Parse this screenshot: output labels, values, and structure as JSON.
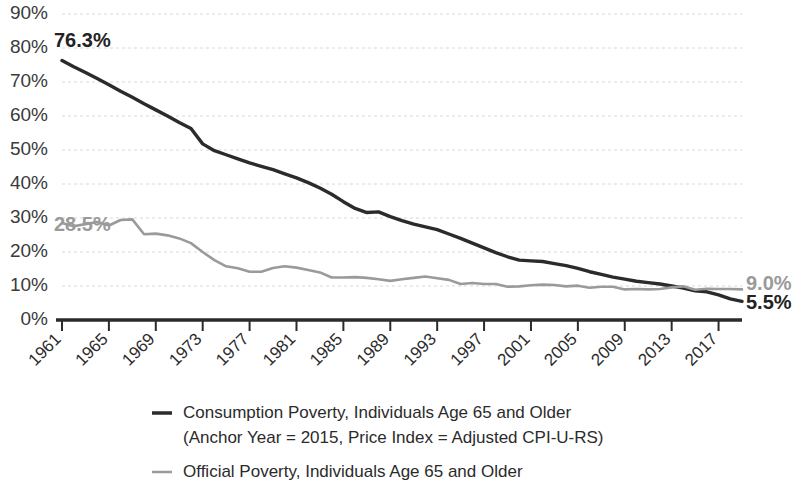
{
  "chart_data": {
    "type": "line",
    "title": "",
    "xlabel": "",
    "ylabel": "",
    "grid": true,
    "legend_position": "bottom",
    "xlim": [
      1961,
      2019
    ],
    "ylim": [
      0,
      90
    ],
    "y_ticks": [
      "0%",
      "10%",
      "20%",
      "30%",
      "40%",
      "50%",
      "60%",
      "70%",
      "80%",
      "90%"
    ],
    "y_tick_values": [
      0,
      10,
      20,
      30,
      40,
      50,
      60,
      70,
      80,
      90
    ],
    "x_ticks": [
      "1961",
      "1965",
      "1969",
      "1973",
      "1977",
      "1981",
      "1985",
      "1989",
      "1993",
      "1997",
      "2001",
      "2005",
      "2009",
      "2013",
      "2017"
    ],
    "x_tick_values": [
      1961,
      1965,
      1969,
      1973,
      1977,
      1981,
      1985,
      1989,
      1993,
      1997,
      2001,
      2005,
      2009,
      2013,
      2017
    ],
    "x": [
      1961,
      1962,
      1963,
      1964,
      1965,
      1966,
      1967,
      1968,
      1969,
      1970,
      1971,
      1972,
      1973,
      1974,
      1975,
      1976,
      1977,
      1978,
      1979,
      1980,
      1981,
      1982,
      1983,
      1984,
      1985,
      1986,
      1987,
      1988,
      1989,
      1990,
      1991,
      1992,
      1993,
      1994,
      1995,
      1996,
      1997,
      1998,
      1999,
      2000,
      2001,
      2002,
      2003,
      2004,
      2005,
      2006,
      2007,
      2008,
      2009,
      2010,
      2011,
      2012,
      2013,
      2014,
      2015,
      2016,
      2017,
      2018,
      2019
    ],
    "series": [
      {
        "name": "Consumption Poverty, Individuals Age 65 and Older (Anchor Year = 2015, Price Index = Adjusted CPI-U-RS)",
        "color": "#2b2b2b",
        "values": [
          76.3,
          74.5,
          72.8,
          71.0,
          69.2,
          67.3,
          65.5,
          63.6,
          61.8,
          60.0,
          58.1,
          56.3,
          51.8,
          49.8,
          48.6,
          47.4,
          46.2,
          45.2,
          44.2,
          43.0,
          41.8,
          40.4,
          38.8,
          37.0,
          34.8,
          32.8,
          31.6,
          31.8,
          30.4,
          29.2,
          28.2,
          27.4,
          26.6,
          25.3,
          24.0,
          22.6,
          21.2,
          19.8,
          18.6,
          17.6,
          17.4,
          17.2,
          16.6,
          16.0,
          15.2,
          14.2,
          13.4,
          12.6,
          12.0,
          11.4,
          11.0,
          10.6,
          10.0,
          9.4,
          8.6,
          8.3,
          7.4,
          6.2,
          5.5
        ]
      },
      {
        "name": "Official Poverty, Individuals Age 65 and Older",
        "color": "#9a9a9a",
        "values": [
          28.5,
          27.6,
          28.2,
          28.8,
          27.8,
          29.4,
          29.6,
          25.2,
          25.4,
          24.9,
          24.0,
          22.6,
          20.0,
          17.6,
          15.8,
          15.2,
          14.2,
          14.2,
          15.3,
          15.8,
          15.4,
          14.7,
          14.0,
          12.5,
          12.5,
          12.6,
          12.4,
          12.0,
          11.5,
          12.0,
          12.4,
          12.8,
          12.3,
          11.8,
          10.6,
          10.9,
          10.6,
          10.6,
          9.8,
          9.9,
          10.2,
          10.4,
          10.3,
          9.9,
          10.1,
          9.5,
          9.8,
          9.8,
          9.0,
          9.1,
          9.0,
          9.1,
          9.6,
          9.9,
          8.9,
          9.2,
          9.1,
          9.1,
          9.0
        ]
      }
    ],
    "annotations": [
      {
        "text": "76.3%",
        "series": "Consumption Poverty, Individuals Age 65 and Older",
        "x": 1961,
        "y": 76.3,
        "color": "#232323"
      },
      {
        "text": "28.5%",
        "series": "Official Poverty, Individuals Age 65 and Older",
        "x": 1961,
        "y": 28.5,
        "color": "#9a9a9a"
      },
      {
        "text": "5.5%",
        "series": "Consumption Poverty, Individuals Age 65 and Older",
        "x": 2019,
        "y": 5.5,
        "color": "#232323"
      },
      {
        "text": "9.0%",
        "series": "Official Poverty, Individuals Age 65 and Older",
        "x": 2019,
        "y": 9.0,
        "color": "#9a9a9a"
      }
    ]
  },
  "legend": {
    "entries": [
      {
        "line1": "Consumption Poverty, Individuals Age 65 and Older",
        "line2": "(Anchor Year = 2015, Price Index = Adjusted CPI-U-RS)",
        "color": "#2b2b2b"
      },
      {
        "line1": "Official Poverty, Individuals Age 65 and Older",
        "line2": "",
        "color": "#9a9a9a"
      }
    ]
  }
}
